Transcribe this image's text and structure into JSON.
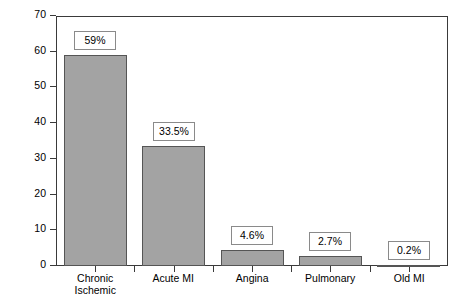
{
  "chart_data": {
    "type": "bar",
    "title": "",
    "xlabel": "",
    "ylabel": "% of  Claims Dollars",
    "categories": [
      "Chronic Ischemic",
      "Acute MI",
      "Angina",
      "Pulmonary",
      "Old MI"
    ],
    "category_lines": [
      [
        "Chronic",
        "Ischemic"
      ],
      [
        "Acute MI"
      ],
      [
        "Angina"
      ],
      [
        "Pulmonary"
      ],
      [
        "Old MI"
      ]
    ],
    "values": [
      59,
      33.5,
      4.6,
      2.7,
      0.2
    ],
    "data_labels": [
      "59%",
      "33.5%",
      "4.6%",
      "2.7%",
      "0.2%"
    ],
    "ylim": [
      0,
      70
    ],
    "yticks": [
      0,
      10,
      20,
      30,
      40,
      50,
      60,
      70
    ],
    "ytick_labels": [
      "0",
      "10",
      "20",
      "30",
      "40",
      "50",
      "60",
      "70"
    ],
    "grid": false,
    "legend": null,
    "bar_color": "#a3a3a3",
    "bar_border_color": "#555555",
    "axis_color": "#3a3a3a",
    "label_box_border_color": "#8a8a8a",
    "background": "#ffffff"
  }
}
